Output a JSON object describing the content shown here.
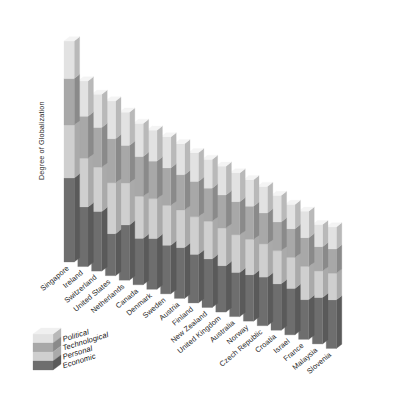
{
  "chart_data": {
    "type": "bar",
    "variant": "stacked-3d-column",
    "title": "",
    "subtitle": "",
    "xlabel": "",
    "ylabel": "Degree of Globalization",
    "grid": false,
    "legend_position": "bottom-left",
    "legend_order_top_to_bottom": [
      "Political",
      "Technological",
      "Personal",
      "Economic"
    ],
    "ylim": [
      0,
      100
    ],
    "y_axis_ticks_visible": false,
    "categories": [
      "Singapore",
      "Ireland",
      "Switzerland",
      "United States",
      "Netherlands",
      "Canada",
      "Denmark",
      "Sweden",
      "Austria",
      "Finland",
      "New Zealand",
      "United Kingdom",
      "Australia",
      "Norway",
      "Czech Republic",
      "Croatia",
      "Israel",
      "France",
      "Malaysia",
      "Slovenia"
    ],
    "series": [
      {
        "name": "Economic",
        "color": "#6e6e6e",
        "values": [
          38,
          27,
          27,
          19,
          25,
          21,
          23,
          22,
          23,
          22,
          22,
          21,
          20,
          21,
          22,
          21,
          21,
          18,
          21,
          22
        ]
      },
      {
        "name": "Personal",
        "color": "#cfcfcf",
        "values": [
          24,
          22,
          20,
          23,
          19,
          19,
          18,
          18,
          17,
          17,
          17,
          17,
          17,
          16,
          15,
          15,
          14,
          15,
          12,
          12
        ]
      },
      {
        "name": "Technological",
        "color": "#a8a8a8",
        "values": [
          21,
          19,
          18,
          20,
          17,
          18,
          17,
          17,
          16,
          16,
          15,
          15,
          15,
          15,
          14,
          13,
          13,
          13,
          11,
          11
        ]
      },
      {
        "name": "Political",
        "color": "#e2e2e2",
        "values": [
          17,
          16,
          15,
          17,
          15,
          15,
          14,
          14,
          14,
          13,
          13,
          13,
          13,
          12,
          12,
          12,
          11,
          12,
          10,
          10
        ]
      }
    ],
    "totals": [
      100,
      84,
      80,
      79,
      76,
      73,
      72,
      71,
      70,
      68,
      67,
      66,
      65,
      64,
      63,
      61,
      59,
      58,
      54,
      55
    ]
  },
  "legend": {
    "items": [
      {
        "label": "Political",
        "color": "#e2e2e2"
      },
      {
        "label": "Technological",
        "color": "#a8a8a8"
      },
      {
        "label": "Personal",
        "color": "#cfcfcf"
      },
      {
        "label": "Economic",
        "color": "#6e6e6e"
      }
    ]
  },
  "style": {
    "background": "#ffffff",
    "front_face_tints": {
      "Political": "#e2e2e2",
      "Technological": "#a8a8a8",
      "Personal": "#cfcfcf",
      "Economic": "#6e6e6e"
    },
    "top_face_shade": "#f2f2f2",
    "side_face_shade": "#9a9a9a",
    "label_color": "#1e1e1e"
  }
}
